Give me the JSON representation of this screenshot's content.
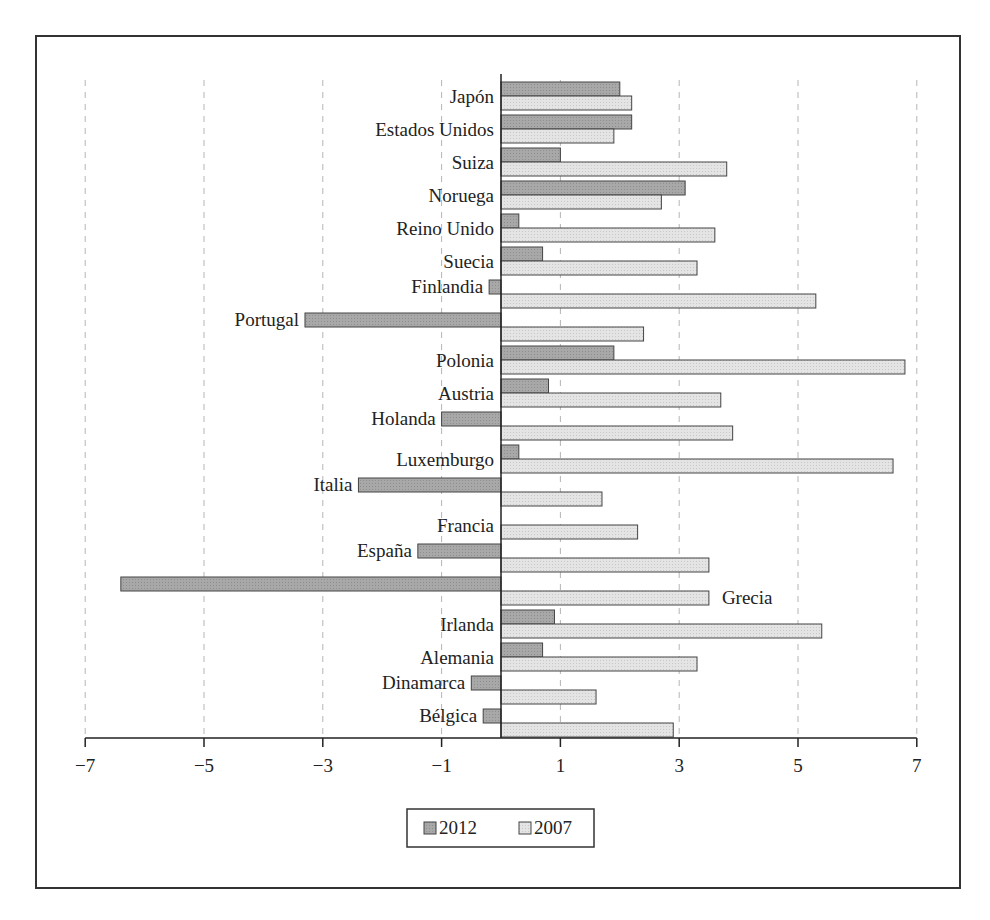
{
  "chart_data": {
    "type": "bar",
    "orientation": "horizontal",
    "title": "",
    "xlabel": "",
    "ylabel": "",
    "xlim": [
      -7,
      7
    ],
    "xticks": [
      -7,
      -5,
      -3,
      -1,
      1,
      3,
      5,
      7
    ],
    "xtick_labels": [
      "−7",
      "−5",
      "−3",
      "−1",
      "1",
      "3",
      "5",
      "7"
    ],
    "grid": "vertical dashed at ticks",
    "legend_position": "bottom center",
    "categories": [
      "Japón",
      "Estados Unidos",
      "Suiza",
      "Noruega",
      "Reino Unido",
      "Suecia",
      "Finlandia",
      "Portugal",
      "Polonia",
      "Austria",
      "Holanda",
      "Luxemburgo",
      "Italia",
      "Francia",
      "España",
      "Grecia",
      "Irlanda",
      "Alemania",
      "Dinamarca",
      "Bélgica"
    ],
    "series": [
      {
        "name": "2012",
        "color": "#a3a3a3",
        "values": [
          2.0,
          2.2,
          1.0,
          3.1,
          0.3,
          0.7,
          -0.2,
          -3.3,
          1.9,
          0.8,
          -1.0,
          0.3,
          -2.4,
          0.0,
          -1.4,
          -6.4,
          0.9,
          0.7,
          -0.5,
          -0.3
        ]
      },
      {
        "name": "2007",
        "color": "#e2e2e2",
        "values": [
          2.2,
          1.9,
          3.8,
          2.7,
          3.6,
          3.3,
          5.3,
          2.4,
          6.8,
          3.7,
          3.9,
          6.6,
          1.7,
          2.3,
          3.5,
          3.5,
          5.4,
          3.3,
          1.6,
          2.9
        ]
      }
    ]
  },
  "legend": {
    "items": [
      {
        "label": "2012",
        "color": "#a3a3a3"
      },
      {
        "label": "2007",
        "color": "#e2e2e2"
      }
    ]
  }
}
